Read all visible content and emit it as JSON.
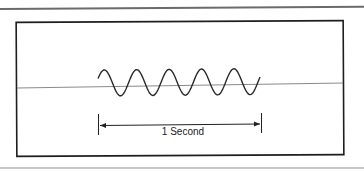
{
  "figure": {
    "caption_label": "1 Second",
    "wave": {
      "cycles": 5,
      "x_start": 98,
      "x_end": 260,
      "center_y": 83,
      "amplitude": 13,
      "stroke": "#2a2a2a"
    },
    "baseline_color": "#8a8a8a",
    "frame_color": "#1e1e1e"
  }
}
